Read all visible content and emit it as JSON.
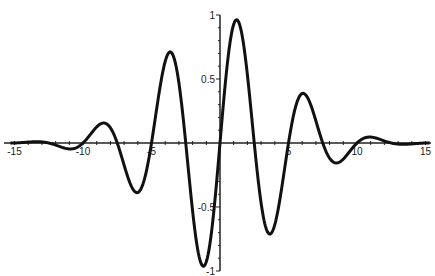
{
  "chart_data": {
    "type": "line",
    "title": "",
    "xlabel": "",
    "ylabel": "",
    "function": "sin(2*pi*x/5) * exp(-x^2/40)",
    "xlim": [
      -15.5,
      15.5
    ],
    "ylim": [
      -1,
      1
    ],
    "grid": false,
    "legend": null,
    "x_ticks": [
      -15,
      -10,
      -5,
      5,
      10,
      15
    ],
    "x_tick_labels": [
      "-15",
      "-10",
      "-5",
      "5",
      "10",
      "15"
    ],
    "y_ticks": [
      1,
      0.5,
      -0.5,
      -1
    ],
    "y_tick_labels": [
      "1",
      "0.5",
      "-0.5",
      "-1"
    ],
    "series": [
      {
        "name": "wave packet",
        "color": "#111111",
        "x": [
          -15,
          -12.5,
          -11.25,
          -10,
          -8.75,
          -7.5,
          -6.25,
          -5,
          -3.75,
          -2.5,
          -1.25,
          0,
          1.25,
          2.5,
          3.75,
          5,
          6.25,
          7.5,
          8.75,
          10,
          11.25,
          12.5,
          15
        ],
        "values": [
          0,
          0,
          -0.04,
          0,
          0.15,
          0,
          -0.38,
          0,
          0.7,
          0,
          -0.96,
          0,
          0.96,
          0,
          -0.7,
          0,
          0.38,
          0,
          -0.15,
          0,
          0.04,
          0,
          0
        ]
      }
    ]
  }
}
